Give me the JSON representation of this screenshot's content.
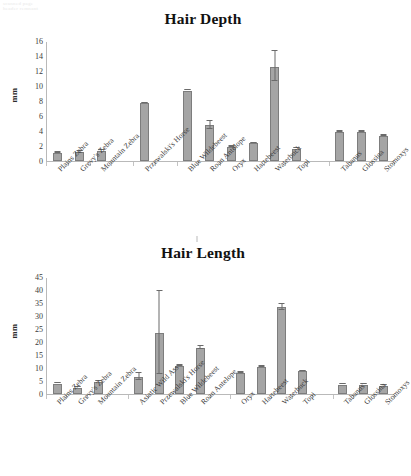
{
  "page": {
    "corner_artifact": "scanned page\nheader remnant"
  },
  "charts": [
    {
      "id": "hair-depth",
      "title": "Hair Depth",
      "ylabel": "mm",
      "yticks": [
        0,
        2,
        4,
        6,
        8,
        10,
        12,
        14,
        16
      ],
      "ymax": 16,
      "categories": [
        "Plains Zebra",
        "Grevy's Zebra",
        "Mountain Zebra",
        "Przewalski's Horse",
        "Blue Wildebeest",
        "Roan Antelope",
        "Oryx",
        "Hartebeest",
        "Waterbuck",
        "Topi",
        "Tabanus",
        "Glossina",
        "Stomoxys"
      ],
      "values": [
        1.1,
        1.15,
        1.4,
        7.7,
        9.4,
        4.75,
        1.85,
        2.35,
        12.6,
        1.65,
        3.85,
        3.9,
        3.35
      ],
      "errors": [
        0.1,
        0.25,
        0.1,
        0.1,
        0.1,
        0.55,
        0.1,
        0.1,
        2.1,
        0.1,
        0.1,
        0.1,
        0.1
      ],
      "slot_gaps_after": [
        2,
        3,
        9
      ]
    },
    {
      "id": "hair-length",
      "title": "Hair Length",
      "ylabel": "mm",
      "yticks": [
        0,
        5,
        10,
        15,
        20,
        25,
        30,
        35,
        40,
        45
      ],
      "ymax": 45,
      "categories": [
        "Plains Zebra",
        "Grevy's Zebra",
        "Mountain Zebra",
        "Asiatic Wild Ass",
        "Przewalski's Horse",
        "Blue Wildebeest",
        "Roan Antelope",
        "Oryx",
        "Hartebeest",
        "Waterbuck",
        "Topi",
        "Tabanus",
        "Glossina",
        "Stomoxys"
      ],
      "values": [
        4.0,
        2.5,
        4.8,
        6.4,
        23.5,
        10.8,
        17.7,
        8.0,
        10.3,
        33.4,
        8.8,
        3.6,
        3.6,
        3.2
      ],
      "errors": [
        0.3,
        0.2,
        0.3,
        1.5,
        16.0,
        0.5,
        0.8,
        0.3,
        0.4,
        1.4,
        0.2,
        0.2,
        0.2,
        0.2
      ],
      "slot_gaps_after": [
        2,
        6,
        10
      ]
    }
  ],
  "chart_data": [
    {
      "type": "bar",
      "title": "Hair Depth",
      "xlabel": "",
      "ylabel": "mm",
      "ylim": [
        0,
        16
      ],
      "ytick_step": 2,
      "grid": false,
      "legend": "none",
      "categories": [
        "Plains Zebra",
        "Grevy's Zebra",
        "Mountain Zebra",
        "Przewalski's Horse",
        "Blue Wildebeest",
        "Roan Antelope",
        "Oryx",
        "Hartebeest",
        "Waterbuck",
        "Topi",
        "Tabanus",
        "Glossina",
        "Stomoxys"
      ],
      "values": [
        1.1,
        1.15,
        1.4,
        7.7,
        9.4,
        4.75,
        1.85,
        2.35,
        12.6,
        1.65,
        3.85,
        3.9,
        3.35
      ],
      "error_bars": [
        0.1,
        0.25,
        0.1,
        0.1,
        0.1,
        0.55,
        0.1,
        0.1,
        2.1,
        0.1,
        0.1,
        0.1,
        0.1
      ],
      "bar_color": "#a5a5a5",
      "bar_edge_color": "#7d7d7d",
      "notes": "Category groups separated by blank gaps: zebras | horse | antelopes | flies (Tabanus, Glossina, Stomoxys)"
    },
    {
      "type": "bar",
      "title": "Hair Length",
      "xlabel": "",
      "ylabel": "mm",
      "ylim": [
        0,
        45
      ],
      "ytick_step": 5,
      "grid": false,
      "legend": "none",
      "categories": [
        "Plains Zebra",
        "Grevy's Zebra",
        "Mountain Zebra",
        "Asiatic Wild Ass",
        "Przewalski's Horse",
        "Blue Wildebeest",
        "Roan Antelope",
        "Oryx",
        "Hartebeest",
        "Waterbuck",
        "Topi",
        "Tabanus",
        "Glossina",
        "Stomoxys"
      ],
      "values": [
        4.0,
        2.5,
        4.8,
        6.4,
        23.5,
        10.8,
        17.7,
        8.0,
        10.3,
        33.4,
        8.8,
        3.6,
        3.6,
        3.2
      ],
      "error_bars": [
        0.3,
        0.2,
        0.3,
        1.5,
        16.0,
        0.5,
        0.8,
        0.3,
        0.4,
        1.4,
        0.2,
        0.2,
        0.2,
        0.2
      ],
      "bar_color": "#a5a5a5",
      "bar_edge_color": "#7d7d7d",
      "notes": "Category groups separated by blank gaps: zebras | equids (Asiatic Wild Ass, Przewalski's Horse) | antelopes | flies"
    }
  ]
}
